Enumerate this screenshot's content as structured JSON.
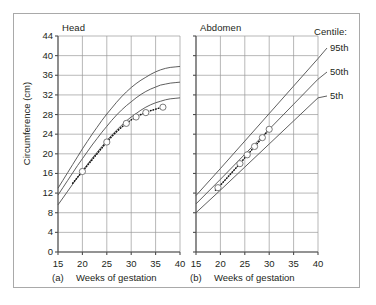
{
  "figure": {
    "y_axis_label": "Circumference (cm)",
    "legend_title": "Centile:",
    "legend_items": [
      {
        "key": "p95",
        "label": "95th"
      },
      {
        "key": "p50",
        "label": "50th"
      },
      {
        "key": "p5",
        "label": "5th"
      }
    ],
    "panels": [
      {
        "key": "head",
        "title": "Head",
        "caption": "(a)",
        "xlabel": "Weeks of gestation"
      },
      {
        "key": "abdomen",
        "title": "Abdomen",
        "caption": "(b)",
        "xlabel": "Weeks of gestation"
      }
    ],
    "colors": {
      "line": "#4d4d4d",
      "grid": "#9a9a9a",
      "axis": "#4d4d4d",
      "text": "#231f20",
      "border": "#a9a9a9",
      "marker_fill": "#ffffff"
    }
  },
  "chart_data": [
    {
      "type": "line",
      "title": "Head",
      "panel": "(a)",
      "xlabel": "Weeks of gestation",
      "ylabel": "Circumference (cm)",
      "xlim": [
        15,
        40
      ],
      "ylim": [
        0,
        44
      ],
      "xticks": [
        15,
        20,
        25,
        30,
        35,
        40
      ],
      "yticks": [
        0,
        4,
        8,
        12,
        16,
        20,
        24,
        28,
        32,
        36,
        40,
        44
      ],
      "grid": true,
      "legend_position": "right-outside",
      "x": [
        15,
        16,
        17,
        18,
        19,
        20,
        21,
        22,
        23,
        24,
        25,
        26,
        27,
        28,
        29,
        30,
        31,
        32,
        33,
        34,
        35,
        36,
        37,
        38,
        39,
        40
      ],
      "series": [
        {
          "name": "95th",
          "values": [
            13.0,
            14.6,
            16.2,
            17.8,
            19.4,
            21.0,
            22.5,
            24.0,
            25.4,
            26.8,
            28.1,
            29.3,
            30.5,
            31.6,
            32.6,
            33.5,
            34.3,
            35.0,
            35.6,
            36.2,
            36.7,
            37.1,
            37.4,
            37.6,
            37.7,
            37.8
          ]
        },
        {
          "name": "50th",
          "values": [
            11.6,
            13.1,
            14.6,
            16.1,
            17.6,
            19.0,
            20.4,
            21.8,
            23.1,
            24.4,
            25.6,
            26.8,
            27.9,
            28.9,
            29.8,
            30.6,
            31.4,
            32.1,
            32.7,
            33.2,
            33.6,
            34.0,
            34.2,
            34.4,
            34.5,
            34.6
          ]
        },
        {
          "name": "5th",
          "values": [
            9.6,
            11.0,
            12.4,
            13.8,
            15.2,
            16.5,
            17.8,
            19.1,
            20.3,
            21.5,
            22.7,
            23.8,
            24.8,
            25.8,
            26.7,
            27.5,
            28.2,
            28.9,
            29.5,
            30.0,
            30.4,
            30.7,
            31.0,
            31.2,
            31.3,
            31.4
          ]
        }
      ],
      "measurements": {
        "name": "Patient measurements",
        "style": "dotted line with open circle markers",
        "x": [
          18.0,
          19.0,
          20.0,
          21.0,
          22.0,
          23.0,
          24.0,
          25.0,
          26.0,
          27.0,
          28.0,
          29.0,
          30.0,
          31.0,
          32.0,
          33.0,
          34.0,
          35.0,
          36.0,
          37.0
        ],
        "y": [
          14.0,
          15.2,
          16.4,
          17.6,
          18.8,
          20.0,
          21.2,
          22.4,
          23.5,
          24.5,
          25.4,
          26.2,
          26.9,
          27.5,
          28.0,
          28.4,
          28.8,
          29.1,
          29.4,
          29.6
        ],
        "marker_x": [
          20.0,
          25.0,
          29.0,
          31.0,
          33.0,
          36.5
        ],
        "marker_y": [
          16.4,
          22.4,
          26.2,
          27.5,
          28.4,
          29.5
        ]
      }
    },
    {
      "type": "line",
      "title": "Abdomen",
      "panel": "(b)",
      "xlabel": "Weeks of gestation",
      "ylabel": "Circumference (cm)",
      "xlim": [
        15,
        40
      ],
      "ylim": [
        0,
        44
      ],
      "xticks": [
        15,
        20,
        25,
        30,
        35,
        40
      ],
      "yticks": [
        0,
        4,
        8,
        12,
        16,
        20,
        24,
        28,
        32,
        36,
        40,
        44
      ],
      "grid": true,
      "legend_position": "right-outside",
      "x": [
        15,
        20,
        25,
        30,
        35,
        40
      ],
      "series": [
        {
          "name": "95th",
          "values": [
            11.5,
            17.0,
            22.6,
            28.2,
            33.8,
            39.4
          ]
        },
        {
          "name": "50th",
          "values": [
            9.8,
            14.8,
            19.9,
            25.0,
            30.1,
            35.2
          ]
        },
        {
          "name": "5th",
          "values": [
            8.0,
            12.6,
            17.3,
            22.0,
            26.7,
            31.4
          ]
        }
      ],
      "measurements": {
        "name": "Patient measurements",
        "style": "dotted line with open circle markers",
        "x": [
          19.0,
          20.0,
          21.0,
          22.0,
          23.0,
          24.0,
          25.0,
          26.0,
          27.0,
          28.0,
          29.0,
          30.0
        ],
        "y": [
          12.6,
          13.6,
          14.7,
          15.8,
          16.9,
          18.0,
          19.2,
          20.3,
          21.5,
          22.6,
          23.8,
          25.0
        ],
        "marker_x": [
          19.5,
          24.0,
          25.5,
          27.0,
          28.6,
          30.0
        ],
        "marker_y": [
          13.1,
          18.0,
          19.8,
          21.5,
          23.3,
          25.0
        ]
      }
    }
  ],
  "axes": {
    "yticks": [
      "44",
      "40",
      "36",
      "32",
      "28",
      "24",
      "20",
      "16",
      "12",
      "8",
      "4",
      "0"
    ],
    "xticks": [
      "15",
      "20",
      "25",
      "30",
      "35",
      "40"
    ]
  }
}
